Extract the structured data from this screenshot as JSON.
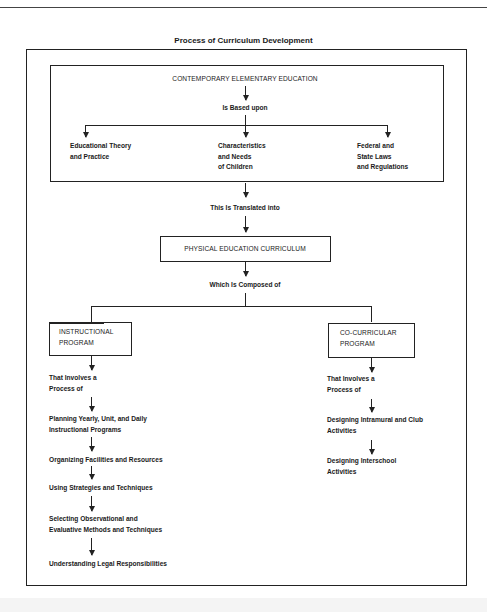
{
  "title": "Process of Curriculum Development",
  "foundation": {
    "heading": "CONTEMPORARY ELEMENTARY EDUCATION",
    "relation": "Is Based upon",
    "bases": [
      {
        "line1": "Educational Theory",
        "line2": "and Practice",
        "line3": ""
      },
      {
        "line1": "Characteristics",
        "line2": "and Needs",
        "line3": "of Children"
      },
      {
        "line1": "Federal and",
        "line2": "State Laws",
        "line3": "and Regulations"
      }
    ]
  },
  "translation": {
    "relation": "This Is Translated into",
    "curriculum": "PHYSICAL EDUCATION CURRICULUM",
    "composed": "Which Is Composed of"
  },
  "instructional": {
    "box_line1": "INSTRUCTIONAL",
    "box_line2": "PROGRAM",
    "involves_line1": "That Involves a",
    "involves_line2": "Process of",
    "steps": [
      {
        "line1": "Planning Yearly, Unit, and Daily",
        "line2": "Instructional Programs"
      },
      {
        "line1": "Organizing Facilities and Resources",
        "line2": ""
      },
      {
        "line1": "Using Strategies and Techniques",
        "line2": ""
      },
      {
        "line1": "Selecting Observational and",
        "line2": "Evaluative Methods and Techniques"
      },
      {
        "line1": "Understanding Legal Responsibilities",
        "line2": ""
      }
    ]
  },
  "cocurricular": {
    "box_line1": "CO-CURRICULAR",
    "box_line2": "PROGRAM",
    "involves_line1": "That Involves a",
    "involves_line2": "Process of",
    "steps": [
      {
        "line1": "Designing Intramural and Club",
        "line2": "Activities"
      },
      {
        "line1": "Designing Interschool",
        "line2": "Activities"
      }
    ]
  }
}
